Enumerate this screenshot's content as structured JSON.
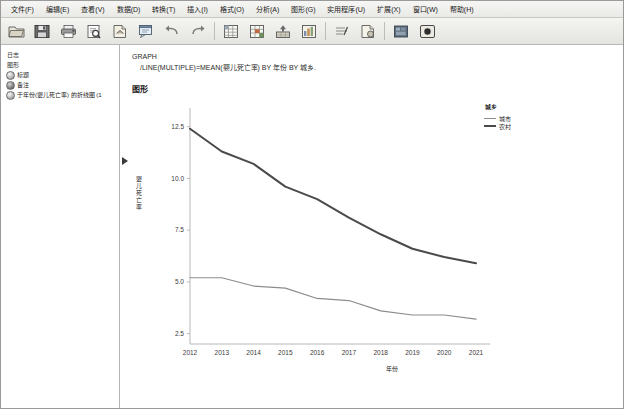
{
  "window": {
    "app": "IBM SPSS Statistics Viewer"
  },
  "menubar": {
    "items": [
      {
        "label": "文件(F)",
        "name": "menu-file"
      },
      {
        "label": "编辑(E)",
        "name": "menu-edit"
      },
      {
        "label": "查看(V)",
        "name": "menu-view"
      },
      {
        "label": "数据(D)",
        "name": "menu-data"
      },
      {
        "label": "转换(T)",
        "name": "menu-transform"
      },
      {
        "label": "插入(I)",
        "name": "menu-insert"
      },
      {
        "label": "格式(O)",
        "name": "menu-format"
      },
      {
        "label": "分析(A)",
        "name": "menu-analyze"
      },
      {
        "label": "图形(G)",
        "name": "menu-graphs"
      },
      {
        "label": "实用程序(U)",
        "name": "menu-utilities"
      },
      {
        "label": "扩展(X)",
        "name": "menu-extensions"
      },
      {
        "label": "窗口(W)",
        "name": "menu-window"
      },
      {
        "label": "帮助(H)",
        "name": "menu-help"
      }
    ]
  },
  "toolbar": {
    "buttons": [
      {
        "icon": "open-file-icon",
        "name": "toolbar-open"
      },
      {
        "icon": "save-icon",
        "name": "toolbar-save"
      },
      {
        "icon": "print-icon",
        "name": "toolbar-print"
      },
      {
        "icon": "print-preview-icon",
        "name": "toolbar-print-preview"
      },
      {
        "icon": "export-icon",
        "name": "toolbar-export"
      },
      {
        "icon": "dialog-recall-icon",
        "name": "toolbar-dialog-recall"
      },
      {
        "icon": "undo-icon",
        "name": "toolbar-undo"
      },
      {
        "icon": "redo-icon",
        "name": "toolbar-redo"
      },
      {
        "icon": "goto-data-icon",
        "name": "toolbar-goto-data"
      },
      {
        "icon": "goto-case-icon",
        "name": "toolbar-goto-case"
      },
      {
        "icon": "variables-icon",
        "name": "toolbar-variables"
      },
      {
        "icon": "insert-chart-icon",
        "name": "toolbar-insert-chart"
      },
      {
        "icon": "promote-icon",
        "name": "toolbar-promote"
      },
      {
        "icon": "demote-icon",
        "name": "toolbar-demote"
      },
      {
        "icon": "show-hide-icon",
        "name": "toolbar-show-hide"
      },
      {
        "icon": "select-icon",
        "name": "toolbar-select"
      }
    ]
  },
  "outline": {
    "nodes": [
      {
        "label": "日志",
        "icon": "none",
        "level": 0,
        "name": "outline-node-log-root"
      },
      {
        "label": "图形",
        "icon": "none",
        "level": 0,
        "name": "outline-node-graph-root"
      },
      {
        "label": "标题",
        "icon": "book-icon",
        "level": 1,
        "name": "outline-node-title"
      },
      {
        "label": "备注",
        "icon": "book-dark-icon",
        "level": 1,
        "name": "outline-node-notes"
      },
      {
        "label": "于年份(婴儿死亡率) 的折线图 (1",
        "icon": "book-icon",
        "level": 1,
        "name": "outline-node-line-chart"
      }
    ]
  },
  "output": {
    "syntax_line_1": "GRAPH",
    "syntax_line_2": "/LINE(MULTIPLE)=MEAN(婴儿死亡率) BY 年份 BY 城乡.",
    "section_title": "图形"
  },
  "chart_data": {
    "type": "line",
    "title": "",
    "xlabel": "年份",
    "ylabel": "婴儿死亡率",
    "x": [
      "2012",
      "2013",
      "2014",
      "2015",
      "2016",
      "2017",
      "2018",
      "2019",
      "2020",
      "2021"
    ],
    "ylim": [
      2.0,
      13.4
    ],
    "yticks": [
      "12.5",
      "10.0",
      "7.5",
      "5.0",
      "2.5"
    ],
    "ytick_values": [
      12.5,
      10.0,
      7.5,
      5.0,
      2.5
    ],
    "grid": false,
    "legend_title": "城乡",
    "legend_position": "right",
    "series": [
      {
        "name": "城市",
        "color": "#8c8c8c",
        "values": [
          5.2,
          5.2,
          4.8,
          4.7,
          4.2,
          4.1,
          3.6,
          3.4,
          3.4,
          3.2
        ]
      },
      {
        "name": "农村",
        "color": "#4a4a4a",
        "values": [
          12.4,
          11.3,
          10.7,
          9.6,
          9.0,
          8.1,
          7.3,
          6.6,
          6.2,
          5.9
        ]
      }
    ]
  }
}
